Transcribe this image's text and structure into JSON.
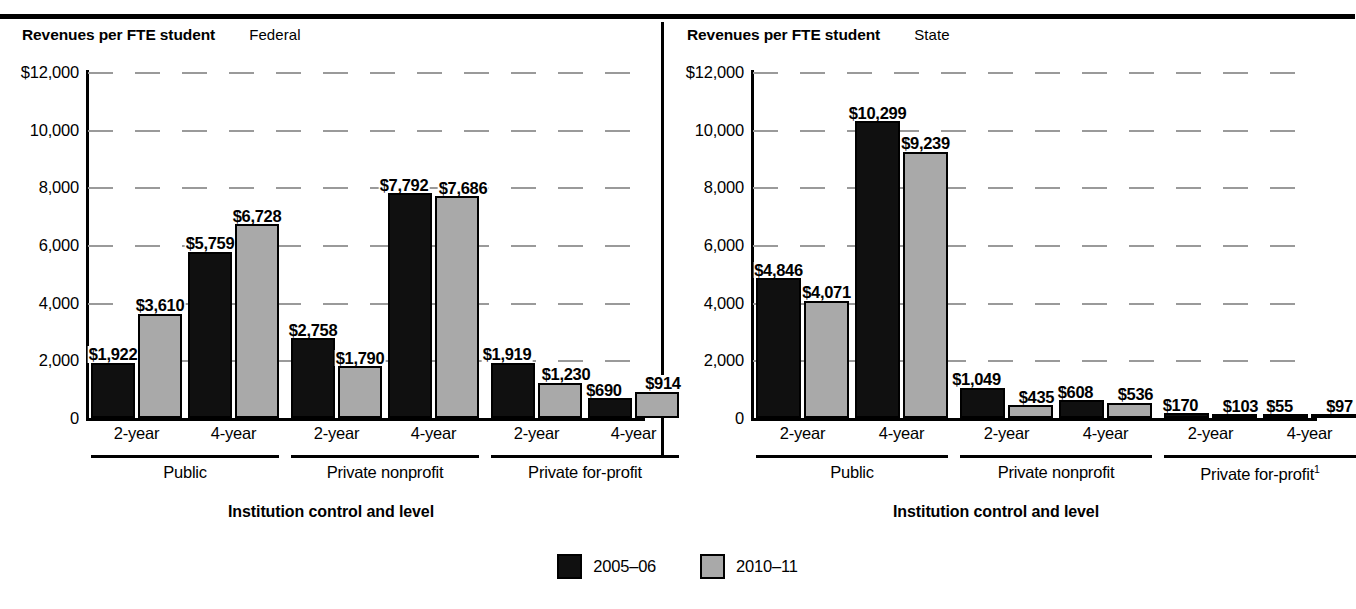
{
  "chart_data": [
    {
      "type": "bar",
      "panel": "left",
      "title": "Revenues per FTE student",
      "series_label": "Federal",
      "xlabel": "Institution control and level",
      "ylabel": "Revenues per FTE student",
      "ylim": [
        0,
        12000
      ],
      "yticks": [
        "$12,000",
        "10,000",
        "8,000",
        "6,000",
        "4,000",
        "2,000",
        "0"
      ],
      "ytick_values": [
        12000,
        10000,
        8000,
        6000,
        4000,
        2000,
        0
      ],
      "grid": true,
      "legend_position": "bottom-center",
      "categories": [
        "2-year",
        "4-year",
        "2-year",
        "4-year",
        "2-year",
        "4-year"
      ],
      "groups": [
        "Public",
        "Private nonprofit",
        "Private for-profit"
      ],
      "series": [
        {
          "name": "2005-06",
          "values": [
            1922,
            5759,
            2758,
            7792,
            1919,
            690
          ],
          "labels": [
            "$1,922",
            "$5,759",
            "$2,758",
            "$7,792",
            "$1,919",
            "$690"
          ]
        },
        {
          "name": "2010-11",
          "values": [
            3610,
            6728,
            1790,
            7686,
            1230,
            914
          ],
          "labels": [
            "$3,610",
            "$6,728",
            "$1,790",
            "$7,686",
            "$1,230",
            "$914"
          ]
        }
      ]
    },
    {
      "type": "bar",
      "panel": "right",
      "title": "Revenues per FTE student",
      "series_label": "State",
      "xlabel": "Institution control and level",
      "ylabel": "Revenues per FTE student",
      "ylim": [
        0,
        12000
      ],
      "yticks": [
        "$12,000",
        "10,000",
        "8,000",
        "6,000",
        "4,000",
        "2,000",
        "0"
      ],
      "ytick_values": [
        12000,
        10000,
        8000,
        6000,
        4000,
        2000,
        0
      ],
      "grid": true,
      "legend_position": "bottom-center",
      "categories": [
        "2-year",
        "4-year",
        "2-year",
        "4-year",
        "2-year",
        "4-year"
      ],
      "groups": [
        "Public",
        "Private nonprofit",
        "Private for-profit"
      ],
      "group_footnotes": [
        "",
        "",
        "1"
      ],
      "series": [
        {
          "name": "2005-06",
          "values": [
            4846,
            10299,
            1049,
            608,
            170,
            55
          ],
          "labels": [
            "$4,846",
            "$10,299",
            "$1,049",
            "$608",
            "$170",
            "$55"
          ]
        },
        {
          "name": "2010-11",
          "values": [
            4071,
            9239,
            435,
            536,
            103,
            97
          ],
          "labels": [
            "$4,071",
            "$9,239",
            "$435",
            "$536",
            "$103",
            "$97"
          ]
        }
      ]
    }
  ],
  "legend": {
    "items": [
      {
        "label": "2005–06",
        "color": "#101010"
      },
      {
        "label": "2010–11",
        "color": "#a9a9a9"
      }
    ]
  },
  "colors": {
    "series_2005_06": "#101010",
    "series_2010_11": "#a9a9a9",
    "axis": "#000000",
    "gridline": "#9a9a9a",
    "background": "#ffffff"
  }
}
